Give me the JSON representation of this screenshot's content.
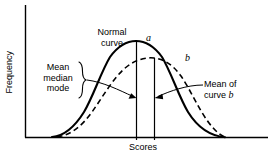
{
  "figure": {
    "axes": {
      "ylabel": "Frequency",
      "xlabel": "Scores"
    },
    "annotations": {
      "normal_curve": "Normal\ncurve",
      "curve_a": "a",
      "curve_b": "b",
      "mean_median_mode": "Mean\nmedian\nmode",
      "mean_of_curve_b_line1": "Mean of",
      "mean_of_curve_b_line2": "curve ",
      "mean_of_curve_b_italic": "b"
    },
    "colors": {
      "ink": "#000000",
      "background": "#ffffff"
    }
  },
  "chart_data": {
    "type": "line",
    "title": "",
    "xlabel": "Scores",
    "ylabel": "Frequency",
    "xlim": [
      0,
      100
    ],
    "ylim": [
      0,
      100
    ],
    "grid": false,
    "legend_position": "none",
    "axis_ticks": {
      "x": [],
      "y": []
    },
    "series": [
      {
        "name": "a",
        "label": "Normal curve",
        "style": "solid",
        "color": "#000000",
        "description": "Symmetric normal (bell) curve; mean, median and mode coincide at the peak.",
        "peak_x": 46,
        "peak_y": 100,
        "x": [
          11,
          16,
          21,
          26,
          31,
          36,
          41,
          46,
          51,
          56,
          61,
          66,
          71,
          76,
          81,
          86
        ],
        "y": [
          0,
          3,
          9,
          22,
          45,
          72,
          93,
          100,
          93,
          72,
          45,
          22,
          9,
          3,
          1,
          0
        ]
      },
      {
        "name": "b",
        "label": "b",
        "style": "dashed",
        "color": "#000000",
        "description": "Flatter, right-shifted curve b with a lower peak; its mean lies to the right of the normal curve's mean.",
        "peak_x": 54,
        "peak_y": 81,
        "x": [
          13,
          18,
          23,
          28,
          33,
          38,
          43,
          48,
          54,
          59,
          64,
          69,
          74,
          79,
          84,
          88
        ],
        "y": [
          0,
          4,
          10,
          20,
          33,
          48,
          63,
          75,
          81,
          79,
          70,
          56,
          40,
          24,
          10,
          0
        ]
      }
    ],
    "vertical_lines": [
      {
        "name": "mean-median-mode-line",
        "x": 46,
        "from_y": 0,
        "to_y": 100,
        "label": "Mean median mode"
      },
      {
        "name": "mean-of-curve-b-line",
        "x": 54,
        "from_y": 0,
        "to_y": 81,
        "label": "Mean of curve b"
      }
    ]
  }
}
